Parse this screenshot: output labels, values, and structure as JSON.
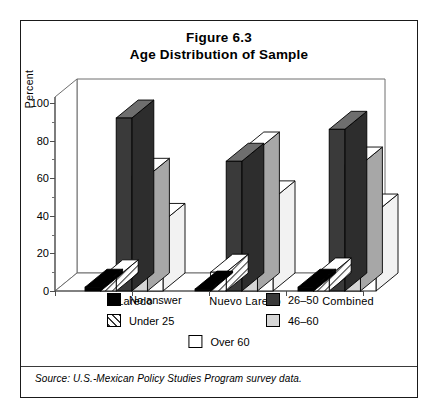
{
  "figure": {
    "title_line1": "Figure 6.3",
    "title_line2": "Age Distribution of Sample",
    "source_note": "Source:  U.S.-Mexican Policy Studies Program survey data."
  },
  "legend": {
    "entries": [
      {
        "label": "No answer",
        "swatch": "black-swatch",
        "color": "#000000"
      },
      {
        "label": "26–50",
        "swatch": "dark-gray-swatch",
        "color": "#3a3a3a"
      },
      {
        "label": "Under 25",
        "swatch": "hatched-swatch",
        "color": "#ffffff"
      },
      {
        "label": "46–60",
        "swatch": "light-gray-swatch",
        "color": "#d6d6d6"
      },
      {
        "label": "Over 60",
        "swatch": "white-swatch",
        "color": "#ffffff"
      }
    ]
  },
  "chart_data": {
    "type": "bar",
    "xlabel": "",
    "ylabel": "Percent",
    "ylim": [
      0,
      100
    ],
    "yticks": [
      0,
      20,
      40,
      60,
      80,
      100
    ],
    "ytick_labels": [
      "0",
      "20",
      "40",
      "60",
      "80",
      "100"
    ],
    "grid": false,
    "legend_position": "below-plot",
    "categories": [
      "Laredo",
      "Nuevo Laredo",
      "Combined"
    ],
    "series": [
      {
        "name": "No answer",
        "values": [
          2,
          1,
          2
        ],
        "color": "#000000",
        "pattern": "solid"
      },
      {
        "name": "Under 25",
        "values": [
          7,
          10,
          8
        ],
        "color": "#ffffff",
        "pattern": "diagonal-hatch"
      },
      {
        "name": "26–50",
        "values": [
          92,
          69,
          86
        ],
        "color": "#3a3a3a",
        "pattern": "solid"
      },
      {
        "name": "46–60",
        "values": [
          61,
          75,
          67
        ],
        "color": "#d6d6d6",
        "pattern": "solid"
      },
      {
        "name": "Over 60",
        "values": [
          37,
          49,
          42
        ],
        "color": "#ffffff",
        "pattern": "solid"
      }
    ]
  }
}
